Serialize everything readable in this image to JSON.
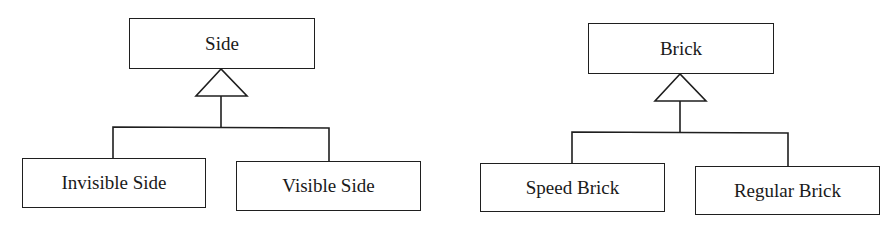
{
  "diagram": {
    "type": "uml-class-inheritance",
    "colors": {
      "stroke": "#1f1f1f",
      "text": "#1a1a1a",
      "background": "#ffffff"
    },
    "hierarchies": [
      {
        "parent": {
          "label": "Side"
        },
        "relation": "generalization",
        "children": [
          {
            "label": "Invisible Side"
          },
          {
            "label": "Visible Side"
          }
        ]
      },
      {
        "parent": {
          "label": "Brick"
        },
        "relation": "generalization",
        "children": [
          {
            "label": "Speed Brick"
          },
          {
            "label": "Regular Brick"
          }
        ]
      }
    ]
  }
}
